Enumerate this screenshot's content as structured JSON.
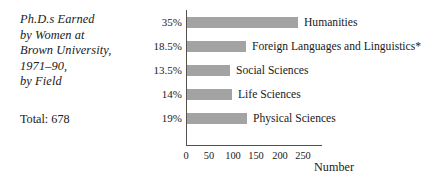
{
  "caption": {
    "lines": [
      "Ph.D.s Earned",
      "by Women at",
      "Brown University,",
      "1971–90,",
      "by Field"
    ],
    "total": "Total: 678"
  },
  "chart_data": {
    "type": "bar",
    "orientation": "horizontal",
    "title": "Ph.D.s Earned by Women at Brown University, 1971–90, by Field",
    "xlabel": "Number",
    "ylabel": "",
    "xlim": [
      0,
      290
    ],
    "grid": false,
    "legend": "none",
    "total": 678,
    "categories": [
      "Humanities",
      "Foreign Languages and Linguistics*",
      "Social Sciences",
      "Life Sciences",
      "Physical Sciences"
    ],
    "values": [
      237,
      125,
      92,
      95,
      129
    ],
    "percent_labels": [
      "35%",
      "18.5%",
      "13.5%",
      "14%",
      "19%"
    ],
    "xticks": [
      0,
      50,
      100,
      150,
      200,
      250
    ],
    "xtick_labels": [
      "0",
      "50",
      "100",
      "150",
      "200",
      "250"
    ],
    "bar_color": "#a3a3a3",
    "axis_color": "#55524e"
  }
}
